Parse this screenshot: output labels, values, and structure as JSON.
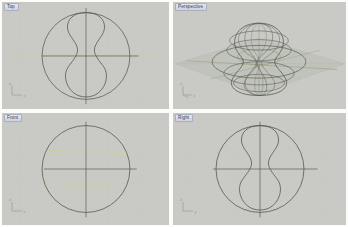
{
  "application": {
    "name": "3D CAD Modeler",
    "layout": "four-viewport",
    "background_color": "#c9cac5",
    "divider_color": "#fcfcfa"
  },
  "viewports": [
    {
      "id": "top",
      "label": "Top",
      "position": "top-left",
      "projection": "orthographic",
      "axis_gizmo": {
        "h_axis": "x",
        "v_axis": "y"
      },
      "geometry": {
        "circle": {
          "cx": 86,
          "cy": 56,
          "r": 45,
          "color": "#53554d"
        },
        "profile_curve": "peanut",
        "axes": {
          "color": "#4e5049"
        },
        "highlight_curve_color": "#cfcf96"
      }
    },
    {
      "id": "perspective",
      "label": "Perspective",
      "position": "top-right",
      "projection": "perspective",
      "axis_gizmo": {
        "h_axis": "x",
        "v_axis": "z"
      },
      "geometry": {
        "ground_plane_color": "#bfc2ba",
        "wireframe_color": "#5a5c52",
        "wireframe_accent_color": "#8c8a5c",
        "object": "revolved-surface-wireframe",
        "isocurve_count": 8
      }
    },
    {
      "id": "front",
      "label": "Front",
      "position": "bottom-left",
      "projection": "orthographic",
      "axis_gizmo": {
        "h_axis": "x",
        "v_axis": "z"
      },
      "geometry": {
        "circle": {
          "cx": 86,
          "cy": 58,
          "r": 45,
          "color": "#53554d"
        },
        "profile_curve": "circle-silhouette",
        "axes": {
          "color": "#4e5049"
        },
        "highlight_curve_color": "#cfcf96"
      }
    },
    {
      "id": "right",
      "label": "Right",
      "position": "bottom-right",
      "projection": "orthographic",
      "axis_gizmo": {
        "h_axis": "y",
        "v_axis": "z"
      },
      "geometry": {
        "circle": {
          "cx": 89,
          "cy": 58,
          "r": 45,
          "color": "#53554d"
        },
        "profile_curve": "peanut",
        "axes": {
          "color": "#4e5049"
        },
        "highlight_curve_color": "#cfcf96"
      }
    }
  ],
  "colors": {
    "viewport_background": "#c9cac5",
    "curve_dark": "#53554d",
    "curve_highlight": "#cfcf96",
    "ground_plane": "#bfc2ba",
    "label_text": "#2a2f45"
  }
}
